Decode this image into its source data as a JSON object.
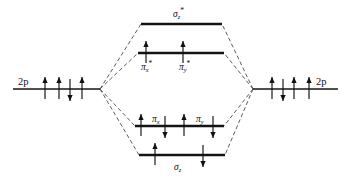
{
  "diagram": {
    "type": "mo-energy-level-diagram",
    "colors": {
      "line": "#141414",
      "correlation": "#4a4a4a",
      "arrow": "#111111",
      "background": "#ffffff"
    },
    "atomic_levels": [
      {
        "id": "left-2p",
        "label": "2p",
        "label_side": "left",
        "x1": 13,
        "x2": 100,
        "y": 89,
        "electrons": [
          "up",
          "up",
          "down",
          "up"
        ],
        "electron_x": [
          45,
          59,
          70,
          82
        ]
      },
      {
        "id": "right-2p",
        "label": "2p",
        "label_side": "right",
        "x1": 253,
        "x2": 338,
        "y": 89,
        "electrons": [
          "up",
          "down",
          "up",
          "up"
        ],
        "electron_x": [
          272,
          283,
          294,
          309
        ]
      }
    ],
    "molecular_levels": [
      {
        "id": "sigma-z-star",
        "label_sigma": "σ",
        "label_sub": "z",
        "label_sup": "*",
        "label_position": "above",
        "x1": 141,
        "x2": 222,
        "y": 24,
        "electrons": [],
        "electron_x": []
      },
      {
        "id": "pi-star",
        "orbitals": [
          {
            "label_pi": "π",
            "label_sub": "x",
            "label_sup": "*"
          },
          {
            "label_pi": "π",
            "label_sub": "y",
            "label_sup": "*"
          }
        ],
        "label_position": "below",
        "x1": 138,
        "x2": 224,
        "y": 53,
        "electrons": [
          "up",
          "up"
        ],
        "electron_x": [
          146,
          183
        ]
      },
      {
        "id": "pi-bonding",
        "orbitals": [
          {
            "label_pi": "π",
            "label_sub": "x",
            "label_sup": ""
          },
          {
            "label_pi": "π",
            "label_sub": "y",
            "label_sup": ""
          }
        ],
        "label_position": "above",
        "x1": 135,
        "x2": 224,
        "y": 126,
        "electrons": [
          "up",
          "down",
          "up",
          "down"
        ],
        "electron_x": [
          141,
          165,
          184,
          213
        ]
      },
      {
        "id": "sigma-z",
        "label_sigma": "σ",
        "label_sub": "z",
        "label_sup": "",
        "label_position": "below",
        "x1": 139,
        "x2": 225,
        "y": 155,
        "electrons": [
          "up",
          "down"
        ],
        "electron_x": [
          155,
          203
        ]
      }
    ],
    "correlation_lines": {
      "left_vertex_x": 100,
      "left_vertex_y": 89,
      "right_vertex_x": 253,
      "right_vertex_y": 89,
      "targets": [
        {
          "level": "sigma-z-star",
          "left_x": 141,
          "right_x": 222,
          "y": 24
        },
        {
          "level": "pi-star",
          "left_x": 138,
          "right_x": 224,
          "y": 53
        },
        {
          "level": "pi-bonding",
          "left_x": 135,
          "right_x": 224,
          "y": 126
        },
        {
          "level": "sigma-z",
          "left_x": 139,
          "right_x": 225,
          "y": 155
        }
      ]
    },
    "labels": {
      "sigma_z_star": {
        "text": "σ",
        "sub": "z",
        "sup": "*",
        "x": 173,
        "y": 17
      },
      "pi_x_star": {
        "text": "π",
        "sub": "x",
        "sup": "*",
        "x": 141,
        "y": 70
      },
      "pi_y_star": {
        "text": "π",
        "sub": "y",
        "sup": "*",
        "x": 179,
        "y": 70
      },
      "pi_x": {
        "text": "π",
        "sub": "x",
        "sup": "",
        "x": 152,
        "y": 122
      },
      "pi_y": {
        "text": "π",
        "sub": "y",
        "sup": "",
        "x": 196,
        "y": 122
      },
      "sigma_z": {
        "text": "σ",
        "sub": "z",
        "sup": "",
        "x": 174,
        "y": 170
      },
      "left_2p": {
        "text": "2p",
        "x": 18,
        "y": 85
      },
      "right_2p": {
        "text": "2p",
        "x": 316,
        "y": 85
      }
    }
  }
}
